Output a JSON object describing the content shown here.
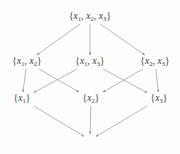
{
  "figure": {
    "type": "hasse-diagram",
    "title": "",
    "background_color": "#fdfdfd",
    "edge_color": "#8a8a8a",
    "text_color": "#3a3a3a"
  },
  "nodes": [
    {
      "id": "top",
      "level": 0,
      "x": 90,
      "y": 17,
      "kind": "set",
      "open": "{",
      "close": "}",
      "elements": [
        {
          "var": "x",
          "sub": "1"
        },
        {
          "var": "x",
          "sub": "2"
        },
        {
          "var": "x",
          "sub": "3"
        }
      ],
      "text": "{x1, x2, x3}"
    },
    {
      "id": "x1x2",
      "level": 1,
      "x": 27,
      "y": 62,
      "kind": "set",
      "open": "{",
      "close": "}",
      "elements": [
        {
          "var": "x",
          "sub": "1"
        },
        {
          "var": "x",
          "sub": "2"
        }
      ],
      "text": "{x1, x2}"
    },
    {
      "id": "x1x3",
      "level": 1,
      "x": 90,
      "y": 62,
      "kind": "set",
      "open": "{",
      "close": "}",
      "elements": [
        {
          "var": "x",
          "sub": "1"
        },
        {
          "var": "x",
          "sub": "3"
        }
      ],
      "text": "{x1, x3}"
    },
    {
      "id": "x2x3",
      "level": 1,
      "x": 155,
      "y": 62,
      "kind": "set",
      "open": "{",
      "close": "}",
      "elements": [
        {
          "var": "x",
          "sub": "2"
        },
        {
          "var": "x",
          "sub": "3"
        }
      ],
      "text": "{x2, x3}"
    },
    {
      "id": "x1",
      "level": 2,
      "x": 22,
      "y": 99,
      "kind": "set",
      "open": "{",
      "close": "}",
      "elements": [
        {
          "var": "x",
          "sub": "1"
        }
      ],
      "text": "{x1}"
    },
    {
      "id": "x2",
      "level": 2,
      "x": 91,
      "y": 99,
      "kind": "set",
      "open": "{",
      "close": "}",
      "elements": [
        {
          "var": "x",
          "sub": "2"
        }
      ],
      "text": "{x2}"
    },
    {
      "id": "x3",
      "level": 2,
      "x": 159,
      "y": 99,
      "kind": "set",
      "open": "{",
      "close": "}",
      "elements": [
        {
          "var": "x",
          "sub": "3"
        }
      ],
      "text": "{x3}"
    },
    {
      "id": "empty",
      "level": 3,
      "x": 90,
      "y": 140,
      "kind": "empty-set",
      "symbol": "∅",
      "text": "∅"
    }
  ],
  "edges": [
    {
      "from": "top",
      "to": "x1x2",
      "arrow": true
    },
    {
      "from": "top",
      "to": "x1x3",
      "arrow": true
    },
    {
      "from": "top",
      "to": "x2x3",
      "arrow": true
    },
    {
      "from": "x1x2",
      "to": "x1",
      "arrow": true
    },
    {
      "from": "x1x2",
      "to": "x2",
      "arrow": true
    },
    {
      "from": "x1x3",
      "to": "x1",
      "arrow": true
    },
    {
      "from": "x1x3",
      "to": "x3",
      "arrow": true
    },
    {
      "from": "x2x3",
      "to": "x2",
      "arrow": true
    },
    {
      "from": "x2x3",
      "to": "x3",
      "arrow": true
    },
    {
      "from": "x1",
      "to": "empty",
      "arrow": true
    },
    {
      "from": "x2",
      "to": "empty",
      "arrow": true
    },
    {
      "from": "x3",
      "to": "empty",
      "arrow": true
    }
  ]
}
